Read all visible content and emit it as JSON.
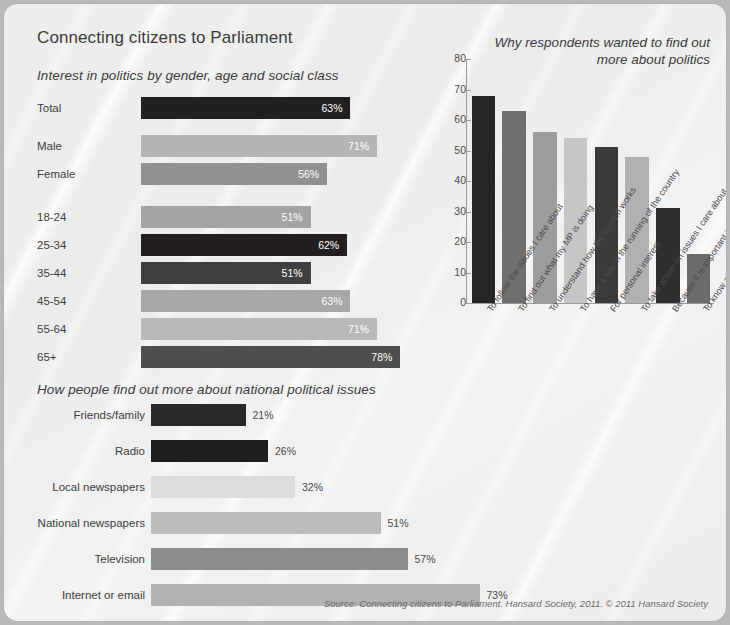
{
  "poster": {
    "title": "Connecting citizens to Parliament",
    "source": "Source: Connecting citizens to Parliament. Hansard Society, 2011. © 2011 Hansard Society",
    "background_color": "#ededed"
  },
  "chart_data": [
    {
      "id": "interest-by-demographics",
      "type": "bar",
      "orientation": "horizontal",
      "title": "Interest in politics by gender, age and social class",
      "xlabel": "",
      "ylabel": "",
      "xlim": [
        0,
        100
      ],
      "grid": false,
      "legend": "none",
      "categories": [
        "Total",
        "Male",
        "Female",
        "18-24",
        "25-34",
        "35-44",
        "45-54",
        "55-64",
        "65+"
      ],
      "values": [
        63,
        71,
        56,
        51,
        62,
        51,
        63,
        71,
        78
      ],
      "value_labels": [
        "63%",
        "71%",
        "56%",
        "51%",
        "62%",
        "51%",
        "63%",
        "71%",
        "78%"
      ],
      "colors": [
        "#211f1f",
        "#b5b5b5",
        "#919191",
        "#a3a3a3",
        "#231f20",
        "#3f3f3f",
        "#a8a8a8",
        "#b9b9b9",
        "#4e4e4e"
      ]
    },
    {
      "id": "why-find-out-more",
      "type": "bar",
      "orientation": "vertical",
      "title": "Why respondents wanted to find out\nmore about politics",
      "title_line1": "Why respondents wanted to find out",
      "title_line2": "more about politics",
      "xlabel": "",
      "ylabel": "",
      "ylim": [
        0,
        80
      ],
      "yticks": [
        0,
        10,
        20,
        30,
        40,
        50,
        60,
        70,
        80
      ],
      "grid": false,
      "legend": "none",
      "categories": [
        "To follow the issues I care about",
        "To find out what my MP is doing",
        "To understand how the system works",
        "To have a say in the running of the country",
        "For personal interest",
        "To take action on issues I care about",
        "Because it is important in order to be a good citizen",
        "To know about the history of Parliament"
      ],
      "values": [
        68,
        63,
        56,
        54,
        51,
        48,
        31,
        16
      ],
      "colors": [
        "#262424",
        "#6f6f6f",
        "#9d9d9d",
        "#c6c6c6",
        "#3a3a3a",
        "#b1b1b1",
        "#2f2d2d",
        "#6b6b6b"
      ]
    },
    {
      "id": "how-people-find-out",
      "type": "bar",
      "orientation": "horizontal",
      "title": "How people find out more about national political issues",
      "xlabel": "",
      "ylabel": "",
      "xlim": [
        0,
        100
      ],
      "grid": false,
      "legend": "none",
      "categories": [
        "Friends/family",
        "Radio",
        "Local newspapers",
        "National newspapers",
        "Television",
        "Internet or email"
      ],
      "values": [
        21,
        26,
        32,
        51,
        57,
        73
      ],
      "value_labels": [
        "21%",
        "26%",
        "32%",
        "51%",
        "57%",
        "73%"
      ],
      "colors": [
        "#2b2828",
        "#1f1d1d",
        "#dcdcdc",
        "#bcbcbc",
        "#8c8c8c",
        "#b2b2b2"
      ]
    }
  ]
}
